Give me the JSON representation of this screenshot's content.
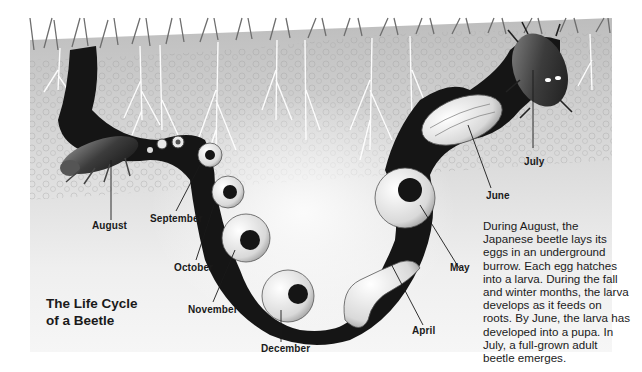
{
  "figure": {
    "title_line1": "The Life Cycle",
    "title_line2": "of a Beetle",
    "caption": "During August, the Japanese beetle lays its eggs in an underground burrow. Each egg hatches into a larva. During the fall and winter months, the larva develops as it feeds on roots. By June, the larva has developed into a pupa. In July, a full-grown adult beetle emerges.",
    "stages": [
      {
        "month": "August",
        "stage": "adult laying eggs"
      },
      {
        "month": "September",
        "stage": "egg / young larva"
      },
      {
        "month": "October",
        "stage": "larva"
      },
      {
        "month": "November",
        "stage": "larva"
      },
      {
        "month": "December",
        "stage": "larva"
      },
      {
        "month": "April",
        "stage": "larva"
      },
      {
        "month": "May",
        "stage": "larva"
      },
      {
        "month": "June",
        "stage": "pupa"
      },
      {
        "month": "July",
        "stage": "adult beetle emerges"
      }
    ],
    "colors": {
      "soil": "#c9c9c9",
      "burrow": "#151515",
      "label_text": "#1a1a1a",
      "background": "#ffffff"
    }
  }
}
